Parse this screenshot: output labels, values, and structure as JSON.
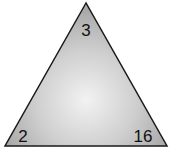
{
  "diagram": {
    "shape": "triangle",
    "fill_center": "#f2f2f2",
    "fill_edge": "#a9a9a9",
    "stroke": "#1a1a1a",
    "labels": {
      "top": "3",
      "bottom_left": "2",
      "bottom_right": "16"
    }
  }
}
